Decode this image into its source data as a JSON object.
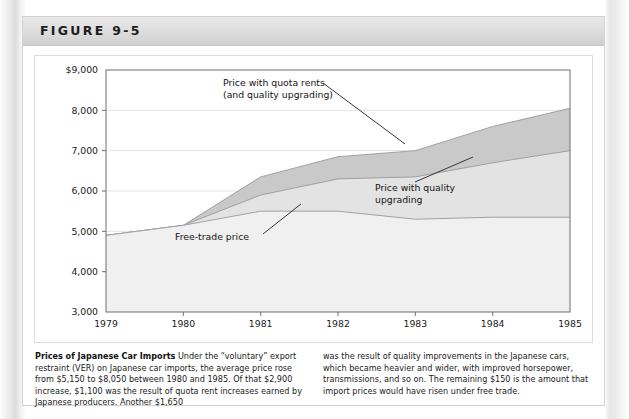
{
  "figure": {
    "label": "FIGURE 9-5"
  },
  "caption": {
    "title": "Prices of Japanese Car Imports",
    "col1": " Under the “voluntary” export restraint (VER) on Japanese car imports, the average price rose from $5,150 to $8,050 between 1980 and 1985. Of that $2,900 increase, $1,100 was the result of quota rent increases earned by Japanese producers. Another $1,650",
    "col2": "was the result of quality improvements in the Japanese cars, which became heavier and wider, with improved horsepower, transmissions, and so on. The remaining $150 is the amount that import prices would have risen under free trade."
  },
  "chart_data": {
    "type": "area",
    "title": "",
    "xlabel": "",
    "ylabel": "",
    "grid": true,
    "legend_position": "inline-annotations",
    "x": [
      1979,
      1980,
      1981,
      1982,
      1983,
      1984,
      1985
    ],
    "xlim": [
      1979,
      1985
    ],
    "ylim": [
      3000,
      9000
    ],
    "ytick_labels": [
      "$9,000",
      "8,000",
      "7,000",
      "6,000",
      "5,000",
      "4,000",
      "3,000"
    ],
    "ytick_values": [
      9000,
      8000,
      7000,
      6000,
      5000,
      4000,
      3000
    ],
    "xtick_labels": [
      "1979",
      "1980",
      "1981",
      "1982",
      "1983",
      "1984",
      "1985"
    ],
    "series": [
      {
        "name": "Price with quota rents (and quality upgrading)",
        "values": [
          4900,
          5150,
          6350,
          6850,
          7000,
          7600,
          8050
        ],
        "color": "#c9c9c9"
      },
      {
        "name": "Price with quality upgrading",
        "values": [
          4900,
          5150,
          5900,
          6300,
          6350,
          6700,
          7000
        ],
        "color": "#e3e3e3"
      },
      {
        "name": "Free-trade price",
        "values": [
          4900,
          5150,
          5500,
          5500,
          5300,
          5350,
          5350
        ],
        "color": "#f0f0f0"
      }
    ],
    "annotations": [
      {
        "name": "quota-rents-label",
        "line1": "Price with quota rents",
        "line2": "(and quality upgrading)"
      },
      {
        "name": "quality-upgrading-label",
        "line1": "Price with quality",
        "line2": "upgrading"
      },
      {
        "name": "free-trade-label",
        "line1": "Free-trade price",
        "line2": ""
      }
    ]
  }
}
